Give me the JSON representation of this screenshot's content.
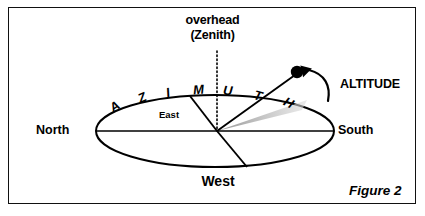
{
  "figure": {
    "caption": "Figure 2",
    "frame_color": "#111111",
    "background": "#ffffff"
  },
  "labels": {
    "overhead_line1": "overhead",
    "overhead_line2": "(Zenith)",
    "north": "North",
    "south": "South",
    "east": "East",
    "west": "West",
    "altitude": "ALTITUDE"
  },
  "azimuth": {
    "word": "AZIMUTH",
    "letters": [
      {
        "char": "A",
        "x": 110,
        "y": 99,
        "rot": -34
      },
      {
        "char": "Z",
        "x": 138,
        "y": 90,
        "rot": -24
      },
      {
        "char": "I",
        "x": 166,
        "y": 85,
        "rot": -14
      },
      {
        "char": "M",
        "x": 193,
        "y": 82,
        "rot": -5
      },
      {
        "char": "U",
        "x": 223,
        "y": 83,
        "rot": 5
      },
      {
        "char": "T",
        "x": 254,
        "y": 88,
        "rot": 16
      },
      {
        "char": "H",
        "x": 284,
        "y": 95,
        "rot": 27
      }
    ]
  },
  "geometry": {
    "horizon_ellipse": {
      "cx": 215,
      "cy": 131,
      "rx": 119,
      "ry": 36
    },
    "center_point": {
      "x": 217,
      "y": 131
    },
    "zenith_dotted_line": {
      "x": 217,
      "y_top": 52,
      "y_bottom": 131
    },
    "north_south_axis": {
      "x1": 96,
      "y1": 131,
      "x2": 334,
      "y2": 131
    },
    "east_radius": {
      "x1": 217,
      "y1": 131,
      "x2": 190,
      "y2": 96
    },
    "west_radius": {
      "x1": 217,
      "y1": 131,
      "x2": 247,
      "y2": 166
    },
    "star_sightline": {
      "x1": 217,
      "y1": 131,
      "x2": 296,
      "y2": 74
    },
    "star_dot": {
      "x": 297,
      "y": 72,
      "r": 6
    },
    "shadow_wedge": {
      "from_x": 217,
      "from_y": 131,
      "to_x": 305,
      "to_y": 105,
      "color": "#b3b3b3"
    },
    "altitude_arrow": {
      "start_x": 324,
      "start_y": 98,
      "tip_x": 306,
      "tip_y": 70
    }
  },
  "colors": {
    "ink": "#000000",
    "shadow_gray": "#b0b0b0",
    "paper": "#ffffff"
  }
}
